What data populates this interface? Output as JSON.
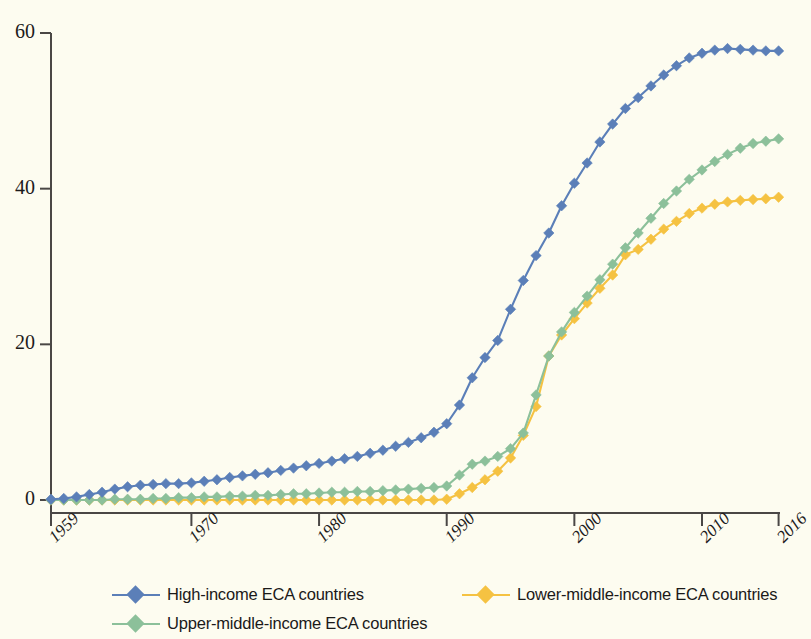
{
  "chart_data": {
    "type": "line",
    "title": "",
    "subtitle": "",
    "xlabel": "",
    "ylabel": "",
    "xlim": [
      1959,
      2016
    ],
    "ylim": [
      0,
      60
    ],
    "grid": false,
    "legend_position": "bottom",
    "background_color": "#fdfcf0",
    "axis_color": "#4a4745",
    "y_ticks": [
      0,
      20,
      40,
      60
    ],
    "y_tick_labels": [
      "0",
      "20",
      "40",
      "60"
    ],
    "x_ticks": [
      1959,
      1970,
      1980,
      1990,
      2000,
      2010,
      2016
    ],
    "x_tick_labels": [
      "1959",
      "1970",
      "1980",
      "1990",
      "2000",
      "2010",
      "2016"
    ],
    "x": [
      1959,
      1960,
      1961,
      1962,
      1963,
      1964,
      1965,
      1966,
      1967,
      1968,
      1969,
      1970,
      1971,
      1972,
      1973,
      1974,
      1975,
      1976,
      1977,
      1978,
      1979,
      1980,
      1981,
      1982,
      1983,
      1984,
      1985,
      1986,
      1987,
      1988,
      1989,
      1990,
      1991,
      1992,
      1993,
      1994,
      1995,
      1996,
      1997,
      1998,
      1999,
      2000,
      2001,
      2002,
      2003,
      2004,
      2005,
      2006,
      2007,
      2008,
      2009,
      2010,
      2011,
      2012,
      2013,
      2014,
      2015,
      2016
    ],
    "series": [
      {
        "name": "High-income ECA countries",
        "color": "#5b7fb8",
        "marker": "diamond",
        "values": [
          0.1,
          0.2,
          0.4,
          0.7,
          1.0,
          1.4,
          1.7,
          1.9,
          2.0,
          2.1,
          2.1,
          2.2,
          2.4,
          2.6,
          2.9,
          3.1,
          3.3,
          3.5,
          3.8,
          4.1,
          4.4,
          4.7,
          5.0,
          5.3,
          5.6,
          6.0,
          6.4,
          6.9,
          7.4,
          8.0,
          8.7,
          9.8,
          12.2,
          15.7,
          18.3,
          20.5,
          24.5,
          28.2,
          31.4,
          34.3,
          37.8,
          40.7,
          43.3,
          46.0,
          48.3,
          50.3,
          51.7,
          53.2,
          54.6,
          55.8,
          56.8,
          57.4,
          57.8,
          58.0,
          57.9,
          57.8,
          57.7,
          57.7
        ]
      },
      {
        "name": "Upper-middle-income ECA countries",
        "color": "#8cc09a",
        "marker": "diamond",
        "values": [
          0.0,
          0.0,
          0.0,
          0.0,
          0.0,
          0.1,
          0.1,
          0.1,
          0.2,
          0.2,
          0.3,
          0.3,
          0.4,
          0.4,
          0.5,
          0.5,
          0.6,
          0.6,
          0.7,
          0.8,
          0.8,
          0.9,
          1.0,
          1.0,
          1.1,
          1.1,
          1.2,
          1.3,
          1.4,
          1.5,
          1.6,
          1.8,
          3.2,
          4.6,
          5.0,
          5.6,
          6.6,
          8.6,
          13.5,
          18.5,
          21.6,
          24.1,
          26.2,
          28.3,
          30.3,
          32.4,
          34.3,
          36.2,
          38.1,
          39.7,
          41.2,
          42.4,
          43.5,
          44.4,
          45.2,
          45.8,
          46.1,
          46.4
        ]
      },
      {
        "name": "Lower-middle-income ECA countries",
        "color": "#f5c242",
        "marker": "diamond",
        "values": [
          0.0,
          0.0,
          0.0,
          0.0,
          0.0,
          0.0,
          0.0,
          0.0,
          0.0,
          0.0,
          0.0,
          0.0,
          0.0,
          0.0,
          0.0,
          0.0,
          0.0,
          0.0,
          0.0,
          0.0,
          0.0,
          0.0,
          0.0,
          0.0,
          0.0,
          0.0,
          0.0,
          0.0,
          0.0,
          0.0,
          0.0,
          0.1,
          0.8,
          1.6,
          2.6,
          3.7,
          5.4,
          8.3,
          12.0,
          18.5,
          21.2,
          23.3,
          25.3,
          27.2,
          28.9,
          31.5,
          32.2,
          33.5,
          34.8,
          35.8,
          36.8,
          37.5,
          38.0,
          38.3,
          38.5,
          38.6,
          38.7,
          38.9
        ]
      }
    ]
  },
  "legend": {
    "items": [
      {
        "label": "High-income ECA countries",
        "color": "#5b7fb8"
      },
      {
        "label": "Lower-middle-income ECA countries",
        "color": "#f5c242"
      },
      {
        "label": "Upper-middle-income ECA countries",
        "color": "#8cc09a"
      }
    ]
  }
}
